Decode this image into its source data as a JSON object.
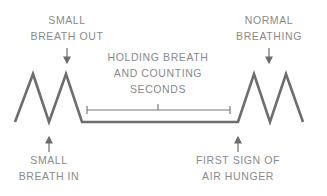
{
  "diagram": {
    "line_color": "#6d6d6d",
    "text_color": "#8a8a8a",
    "labels": {
      "small_breath_out": [
        "SMALL",
        "BREATH OUT"
      ],
      "normal_breathing": [
        "NORMAL",
        "BREATHING"
      ],
      "holding_breath": [
        "HOLDING BREATH",
        "AND COUNTING",
        "SECONDS"
      ],
      "small_breath_in": [
        "SMALL",
        "BREATH IN"
      ],
      "first_sign_air_hunger": [
        "FIRST SIGN OF",
        "AIR HUNGER"
      ]
    }
  }
}
